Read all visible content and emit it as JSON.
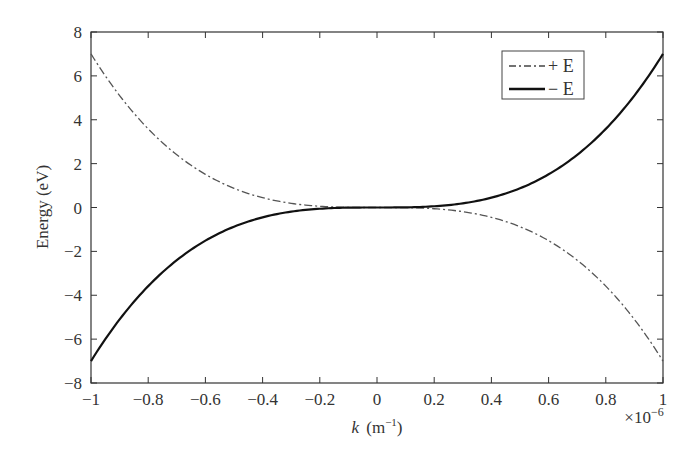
{
  "chart_data": {
    "type": "line",
    "title": "",
    "xlabel": "k (m⁻¹)",
    "xlabel_italic": "k",
    "xlabel_unit": "(m",
    "xlabel_sup": "−1",
    "xlabel_close": ")",
    "x_multiplier": "×10",
    "x_multiplier_exp": "−6",
    "ylabel": "Energy (eV)",
    "xlim": [
      -1,
      1
    ],
    "ylim": [
      -8,
      8
    ],
    "grid": false,
    "legend_position": "upper right",
    "x_ticks": [
      -1,
      -0.8,
      -0.6,
      -0.4,
      -0.2,
      0,
      0.2,
      0.4,
      0.6,
      0.8,
      1
    ],
    "x_tick_labels": [
      "−1",
      "−0.8",
      "−0.6",
      "−0.4",
      "−0.2",
      "0",
      "0.2",
      "0.4",
      "0.6",
      "0.8",
      "1"
    ],
    "y_ticks": [
      8,
      6,
      4,
      2,
      0,
      -2,
      -4,
      -6,
      -8
    ],
    "y_tick_labels": [
      "8",
      "6",
      "4",
      "2",
      "0",
      "−2",
      "−4",
      "−6",
      "−8"
    ],
    "x": [
      -1,
      -0.9,
      -0.8,
      -0.7,
      -0.6,
      -0.5,
      -0.4,
      -0.3,
      -0.2,
      -0.1,
      0,
      0.1,
      0.2,
      0.3,
      0.4,
      0.5,
      0.6,
      0.7,
      0.8,
      0.9,
      1
    ],
    "series": [
      {
        "name": "+E",
        "legend_label": "+ E",
        "style": "dash-dot",
        "color": "#555555",
        "values": [
          7.0,
          5.1,
          3.58,
          2.4,
          1.51,
          0.88,
          0.45,
          0.19,
          0.06,
          0.01,
          0,
          -0.01,
          -0.06,
          -0.19,
          -0.45,
          -0.88,
          -1.51,
          -2.4,
          -3.58,
          -5.1,
          -7.0
        ]
      },
      {
        "name": "-E",
        "legend_label": "− E",
        "style": "solid",
        "color": "#111111",
        "values": [
          -7.0,
          -5.1,
          -3.58,
          -2.4,
          -1.51,
          -0.88,
          -0.45,
          -0.19,
          -0.06,
          -0.01,
          0,
          0.01,
          0.06,
          0.19,
          0.45,
          0.88,
          1.51,
          2.4,
          3.58,
          5.1,
          7.0
        ]
      }
    ]
  }
}
